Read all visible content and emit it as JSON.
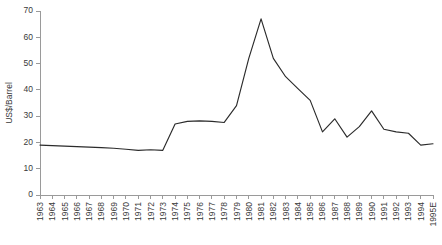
{
  "chart_data": {
    "type": "line",
    "title": "",
    "subtitle": "",
    "xlabel": "",
    "ylabel": "US$/Barrel",
    "ylim": [
      0,
      70
    ],
    "ytick_values": [
      0,
      10,
      20,
      30,
      40,
      50,
      60,
      70
    ],
    "ytick_labels": [
      "0",
      "10",
      "20",
      "30",
      "40",
      "50",
      "60",
      "70"
    ],
    "grid": false,
    "legend": null,
    "legend_position": "none",
    "categories": [
      "1963",
      "1964",
      "1965",
      "1966",
      "1967",
      "1968",
      "1969",
      "1970",
      "1971",
      "1972",
      "1973",
      "1974",
      "1975",
      "1976",
      "1977",
      "1978",
      "1979",
      "1980",
      "1981",
      "1982",
      "1983",
      "1984",
      "1985",
      "1986",
      "1987",
      "1988",
      "1989",
      "1990",
      "1991",
      "1992",
      "1993",
      "1994",
      "1995E"
    ],
    "series": [
      {
        "name": "Crude oil price",
        "values": [
          19.0,
          18.8,
          18.6,
          18.4,
          18.2,
          18.0,
          17.8,
          17.4,
          17.0,
          17.2,
          17.0,
          27.0,
          28.0,
          28.2,
          28.0,
          27.6,
          34.0,
          52.0,
          67.0,
          52.0,
          45.0,
          40.5,
          36.0,
          24.0,
          29.0,
          22.0,
          26.0,
          32.0,
          25.0,
          24.0,
          23.5,
          19.0,
          19.5
        ]
      }
    ]
  },
  "colors": {
    "line": "#2b2b2b",
    "axis": "#9a9a9a",
    "text": "#3a3a3a",
    "background": "#ffffff"
  }
}
